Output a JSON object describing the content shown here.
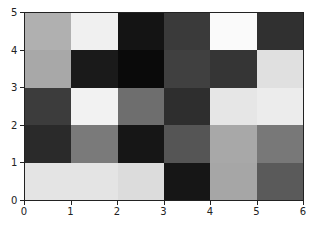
{
  "chart_data": {
    "type": "heatmap",
    "title": "",
    "xlabel": "",
    "ylabel": "",
    "xlim": [
      0,
      6
    ],
    "ylim": [
      0,
      5
    ],
    "x_ticks": [
      "0",
      "1",
      "2",
      "3",
      "4",
      "5",
      "6"
    ],
    "y_ticks": [
      "0",
      "1",
      "2",
      "3",
      "4",
      "5"
    ],
    "colormap": "gray",
    "rows_top_to_bottom": [
      {
        "y_range": [
          4,
          5
        ],
        "colors": [
          "#b0b0b0",
          "#f0f0f0",
          "#141414",
          "#3a3a3a",
          "#fafafa",
          "#303030"
        ]
      },
      {
        "y_range": [
          3,
          4
        ],
        "colors": [
          "#a8a8a8",
          "#1a1a1a",
          "#0a0a0a",
          "#404040",
          "#353535",
          "#e0e0e0"
        ]
      },
      {
        "y_range": [
          2,
          3
        ],
        "colors": [
          "#3c3c3c",
          "#f2f2f2",
          "#6e6e6e",
          "#2e2e2e",
          "#e6e6e6",
          "#ececec"
        ]
      },
      {
        "y_range": [
          1,
          2
        ],
        "colors": [
          "#2a2a2a",
          "#7a7a7a",
          "#161616",
          "#555555",
          "#a8a8a8",
          "#787878"
        ]
      },
      {
        "y_range": [
          0,
          1
        ],
        "colors": [
          "#e4e4e4",
          "#e4e4e4",
          "#dcdcdc",
          "#161616",
          "#a6a6a6",
          "#5a5a5a"
        ]
      }
    ],
    "legend": null,
    "grid": false
  }
}
